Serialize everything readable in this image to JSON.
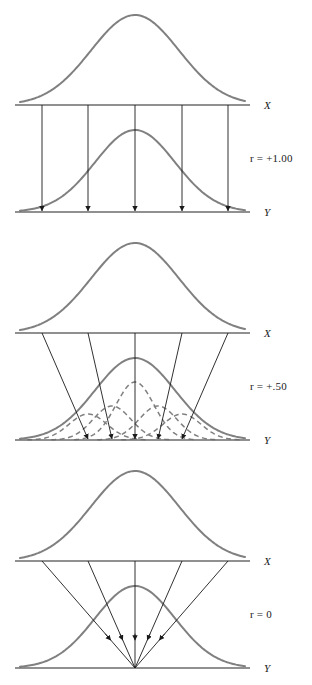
{
  "figure": {
    "background": "#ffffff",
    "width": 312,
    "height": 685
  },
  "style": {
    "curve_color": "#808080",
    "curve_width": 2.0,
    "axis_color": "#6b6b6b",
    "axis_width": 1.6,
    "connector_color": "#1a1a1a",
    "connector_width": 0.9,
    "dashed_color": "#808080",
    "text_color": "#1a1a1a"
  },
  "chart_data": {
    "type": "line",
    "xlabel": "",
    "ylabel": "",
    "panels": [
      {
        "id": "panel-r-100",
        "r_label": "r = +1.00",
        "r_value": "+1.00",
        "r_symbol": "r",
        "r_equals": "=",
        "top_axis_label": "X",
        "bottom_axis_label": "Y",
        "top_curve": {
          "name": "X distribution",
          "style": "solid",
          "mean": 135,
          "sigma": 44,
          "peak_height": 90,
          "baseline_y": 105
        },
        "bottom_curve": {
          "name": "Y distribution",
          "style": "solid",
          "mean": 135,
          "sigma": 40,
          "peak_height": 82,
          "baseline_y": 212
        },
        "connector_type": "vertical",
        "connector_x_top": [
          42,
          88,
          135,
          182,
          228
        ],
        "connector_x_bottom": [
          42,
          88,
          135,
          182,
          228
        ],
        "sub_curves": [],
        "note": "Perfect positive correlation: each X value maps to exactly one Y value, rank order preserved."
      },
      {
        "id": "panel-r-050",
        "r_label": "r = +.50",
        "r_value": "+.50",
        "r_symbol": "r",
        "r_equals": "=",
        "top_axis_label": "X",
        "bottom_axis_label": "Y",
        "top_curve": {
          "name": "X distribution",
          "style": "solid",
          "mean": 135,
          "sigma": 44,
          "peak_height": 90,
          "baseline_y": 105
        },
        "bottom_curve": {
          "name": "Y distribution",
          "style": "solid",
          "mean": 135,
          "sigma": 40,
          "peak_height": 82,
          "baseline_y": 212
        },
        "connector_type": "converging",
        "connector_x_top": [
          42,
          88,
          135,
          182,
          228
        ],
        "connector_x_bottom": [
          88,
          112,
          135,
          158,
          182
        ],
        "sub_curves": [
          {
            "name": "conditional Y | X1",
            "style": "dashed",
            "mean": 88,
            "sigma": 19,
            "peak_height": 26
          },
          {
            "name": "conditional Y | X2",
            "style": "dashed",
            "mean": 112,
            "sigma": 19,
            "peak_height": 34
          },
          {
            "name": "conditional Y | X3",
            "style": "dashed",
            "mean": 135,
            "sigma": 19,
            "peak_height": 58
          },
          {
            "name": "conditional Y | X4",
            "style": "dashed",
            "mean": 158,
            "sigma": 19,
            "peak_height": 34
          },
          {
            "name": "conditional Y | X5",
            "style": "dashed",
            "mean": 182,
            "sigma": 19,
            "peak_height": 26
          }
        ],
        "note": "Moderate positive correlation: X values map to overlapping conditional Y distributions."
      },
      {
        "id": "panel-r-0",
        "r_label": "r = 0",
        "r_value": "0",
        "r_symbol": "r",
        "r_equals": "=",
        "top_axis_label": "X",
        "bottom_axis_label": "Y",
        "top_curve": {
          "name": "X distribution",
          "style": "solid",
          "mean": 135,
          "sigma": 44,
          "peak_height": 90,
          "baseline_y": 105
        },
        "bottom_curve": {
          "name": "Y distribution",
          "style": "solid",
          "mean": 135,
          "sigma": 40,
          "peak_height": 82,
          "baseline_y": 212
        },
        "connector_type": "point-convergent",
        "connector_x_top": [
          42,
          88,
          135,
          182,
          228
        ],
        "connector_x_bottom": [
          135,
          135,
          135,
          135,
          135
        ],
        "sub_curves": [],
        "note": "Zero correlation: all X values converge to the same expected Y value."
      }
    ],
    "axis_x_start": 15,
    "axis_x_end": 250,
    "legend": [],
    "grid": false
  }
}
